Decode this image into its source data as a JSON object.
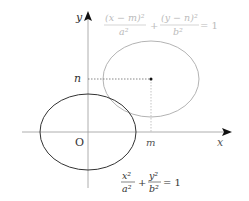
{
  "diagram": {
    "axes": {
      "x_label": "x",
      "y_label": "y",
      "origin_label": "O",
      "m_label": "m",
      "n_label": "n"
    },
    "ellipse_original": {
      "equation_num1": "x²",
      "equation_den1": "a²",
      "equation_num2": "y²",
      "equation_den2": "b²",
      "plus": "+",
      "equals": "= 1",
      "color": "#333333"
    },
    "ellipse_translated": {
      "equation_num1": "(x − m)²",
      "equation_den1": "a²",
      "equation_num2": "(y − n)²",
      "equation_den2": "b²",
      "plus": "+",
      "equals": "= 1",
      "color": "#b0b0b0"
    },
    "center_point": {
      "label_x": "m",
      "label_y": "n"
    }
  }
}
